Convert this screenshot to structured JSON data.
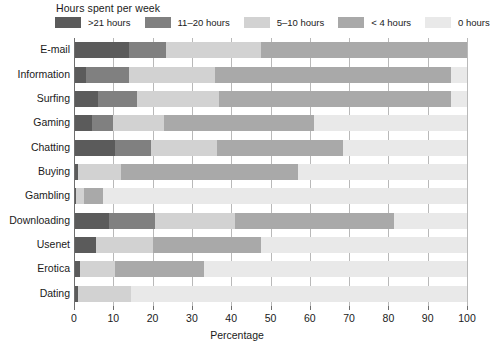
{
  "chart_data": {
    "type": "bar",
    "orientation": "horizontal",
    "stacked": true,
    "stacked_mode": "percent",
    "title": "",
    "legend_title": "Hours spent per week",
    "legend_position": "top",
    "xlabel": "Percentage",
    "ylabel": "",
    "xlim": [
      0,
      100
    ],
    "xticks": [
      0,
      10,
      20,
      30,
      40,
      50,
      60,
      70,
      80,
      90,
      100
    ],
    "xtick_labels": [
      "0",
      "10",
      "20",
      "30",
      "40",
      "50",
      "60",
      "70",
      "80",
      "90",
      "100"
    ],
    "grid": true,
    "grid_axis": "x",
    "categories": [
      "E-mail",
      "Information",
      "Surfing",
      "Gaming",
      "Chatting",
      "Buying",
      "Gambling",
      "Downloading",
      "Usenet",
      "Erotica",
      "Dating"
    ],
    "series": [
      {
        "name": ">21 hours",
        "color": "#5b5b5b",
        "values": [
          14.0,
          3.0,
          6.0,
          4.5,
          10.5,
          1.0,
          0.5,
          9.0,
          5.5,
          1.5,
          1.0
        ]
      },
      {
        "name": "11–20 hours",
        "color": "#808080",
        "values": [
          9.5,
          11.0,
          10.0,
          5.5,
          9.0,
          0.0,
          0.0,
          11.5,
          0.0,
          0.0,
          0.0
        ]
      },
      {
        "name": "5–10 hours",
        "color": "#d2d2d2",
        "values": [
          24.0,
          22.0,
          21.0,
          13.0,
          17.0,
          11.0,
          2.0,
          20.5,
          14.5,
          9.0,
          13.5
        ]
      },
      {
        "name": "< 4 hours",
        "color": "#a9a9a9",
        "values": [
          52.5,
          60.0,
          59.0,
          38.0,
          32.0,
          45.0,
          5.0,
          40.5,
          27.5,
          22.5,
          0.0
        ]
      },
      {
        "name": "0 hours",
        "color": "#e9e9e9",
        "values": [
          0.0,
          4.0,
          4.0,
          39.0,
          31.5,
          43.0,
          92.5,
          18.5,
          52.5,
          67.0,
          85.5
        ]
      }
    ]
  },
  "axis": {
    "x_title": "Percentage"
  }
}
